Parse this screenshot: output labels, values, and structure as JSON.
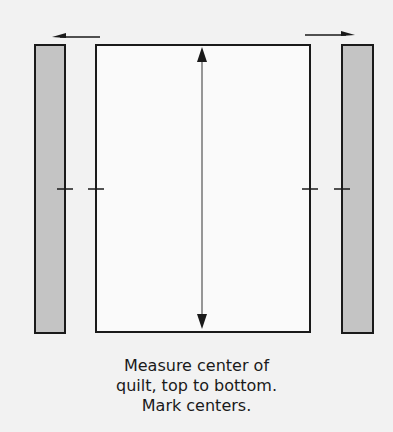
{
  "diagram": {
    "colors": {
      "background": "#f2f2f2",
      "quilt_fill": "#fafafa",
      "strip_fill": "#c4c4c4",
      "stroke": "#1a1a1a"
    },
    "elements": {
      "left_strip": {
        "label": "left border strip"
      },
      "quilt_top": {
        "label": "quilt top"
      },
      "right_strip": {
        "label": "right border strip"
      },
      "left_arrow": {
        "direction": "left"
      },
      "right_arrow": {
        "direction": "right"
      },
      "measure_arrow": {
        "direction": "top-to-bottom"
      },
      "center_marks": {
        "count": 4
      }
    }
  },
  "caption": {
    "lines": [
      "Measure center of",
      "quilt, top to bottom.",
      "Mark centers."
    ]
  }
}
